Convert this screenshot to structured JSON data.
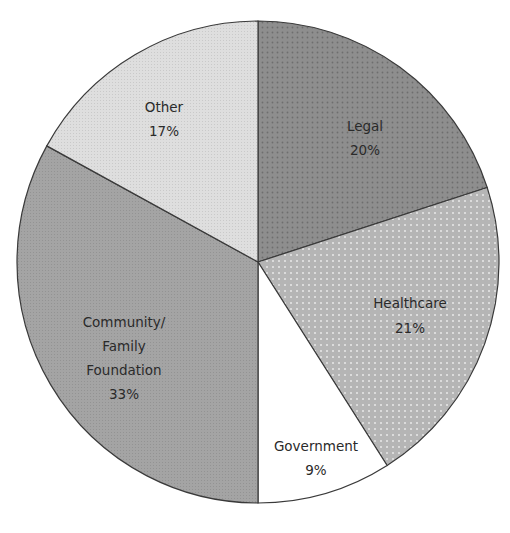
{
  "chart_data": {
    "type": "pie",
    "title": "",
    "start_angle_deg": 0,
    "direction": "clockwise",
    "slices": [
      {
        "label": "Legal",
        "value": 20,
        "display": "20%",
        "fill": "#8c8c8c",
        "pattern": "dark-dots"
      },
      {
        "label": "Healthcare",
        "value": 21,
        "display": "21%",
        "fill": "#b8b8b8",
        "pattern": "light-dots"
      },
      {
        "label": "Government",
        "value": 9,
        "display": "9%",
        "fill": "#ffffff",
        "pattern": "none"
      },
      {
        "label": "Community/ Family Foundation",
        "label_lines": [
          "Community/",
          "Family",
          "Foundation"
        ],
        "value": 33,
        "display": "33%",
        "fill": "#a6a6a6",
        "pattern": "fine-grain"
      },
      {
        "label": "Other",
        "value": 17,
        "display": "17%",
        "fill": "#dcdcdc",
        "pattern": "fine-grain"
      }
    ],
    "legend": "none (labels inside slices)"
  },
  "labels": {
    "legal": {
      "name": "Legal",
      "pct": "20%"
    },
    "healthcare": {
      "name": "Healthcare",
      "pct": "21%"
    },
    "government": {
      "name": "Government",
      "pct": "9%"
    },
    "community": {
      "line1": "Community/",
      "line2": "Family",
      "line3": "Foundation",
      "pct": "33%"
    },
    "other": {
      "name": "Other",
      "pct": "17%"
    }
  }
}
